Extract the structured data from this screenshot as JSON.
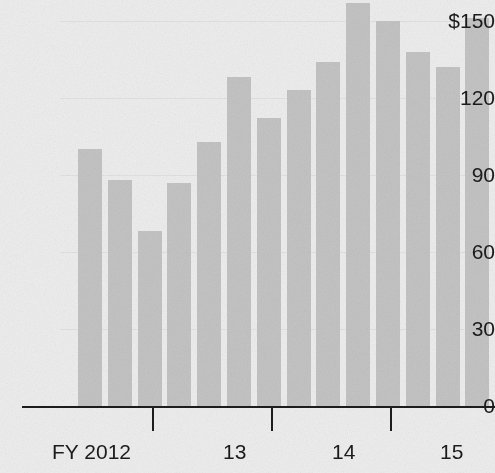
{
  "chart_data": {
    "type": "bar",
    "title": "",
    "subtitle": "",
    "xlabel": "",
    "ylabel": "",
    "ylim": [
      0,
      157
    ],
    "grid": true,
    "legend": null,
    "currency_prefix": "$",
    "categories": [
      "FY 2012 Q1",
      "FY 2012 Q2",
      "FY 2012 Q3",
      "FY 2012 Q4",
      "FY 2013 Q1",
      "FY 2013 Q2",
      "FY 2013 Q3",
      "FY 2013 Q4",
      "FY 2014 Q1",
      "FY 2014 Q2",
      "FY 2014 Q3",
      "FY 2014 Q4",
      "FY 2015 Q1",
      "FY 2015 Q2",
      "FY 2015 Q3",
      "FY 2015 Q4"
    ],
    "values": [
      100,
      88,
      68,
      87,
      103,
      128,
      112,
      123,
      134,
      157,
      150,
      138,
      132,
      151,
      107,
      89
    ],
    "y_ticks": [
      {
        "value": 150,
        "label": "$150"
      },
      {
        "value": 120,
        "label": "120"
      },
      {
        "value": 90,
        "label": "90"
      },
      {
        "value": 60,
        "label": "60"
      },
      {
        "value": 30,
        "label": "30"
      },
      {
        "value": 0,
        "label": "0"
      }
    ],
    "x_groups": [
      {
        "label": "FY 2012",
        "bars": 4
      },
      {
        "label": "13",
        "bars": 4
      },
      {
        "label": "14",
        "bars": 4
      },
      {
        "label": "15",
        "bars": 4
      }
    ],
    "colors": {
      "bar": "#c4c4c4",
      "axis": "#1d1d1d",
      "text": "#1b1b1b",
      "background": "#eeeeee",
      "gridline": "#e2e2e2"
    }
  },
  "geometry": {
    "baseline_y": 406,
    "px_per_unit": 2.567,
    "plot_left": 78,
    "bar_width": 24,
    "bar_pitch": 29.8,
    "axis_left": 22,
    "axis_right": 495,
    "tick_positions": [
      152,
      271,
      390
    ],
    "group_label_positions": [
      52,
      223,
      332,
      440
    ],
    "group_label_y": 441
  }
}
